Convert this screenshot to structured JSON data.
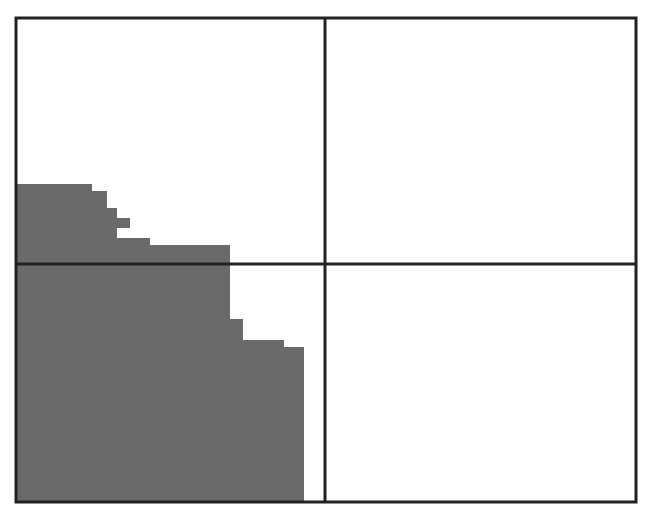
{
  "canvas": {
    "width": 649,
    "height": 512,
    "background": "#ffffff"
  },
  "grid": {
    "rows": 2,
    "cols": 2,
    "frame": {
      "x": 16,
      "y": 18,
      "width": 620,
      "height": 484
    },
    "divider_x": 325,
    "divider_y": 264,
    "line_color": "#222222",
    "line_width": 3
  },
  "region": {
    "fill": "#6a6a6a",
    "points": [
      [
        17,
        184
      ],
      [
        92,
        184
      ],
      [
        92,
        191
      ],
      [
        107,
        191
      ],
      [
        107,
        208
      ],
      [
        117,
        208
      ],
      [
        117,
        218
      ],
      [
        130,
        218
      ],
      [
        130,
        228
      ],
      [
        117,
        228
      ],
      [
        117,
        238
      ],
      [
        150,
        238
      ],
      [
        150,
        245
      ],
      [
        230,
        245
      ],
      [
        230,
        319
      ],
      [
        243,
        319
      ],
      [
        243,
        340
      ],
      [
        284,
        340
      ],
      [
        284,
        347
      ],
      [
        304,
        347
      ],
      [
        304,
        501
      ],
      [
        17,
        501
      ]
    ]
  }
}
